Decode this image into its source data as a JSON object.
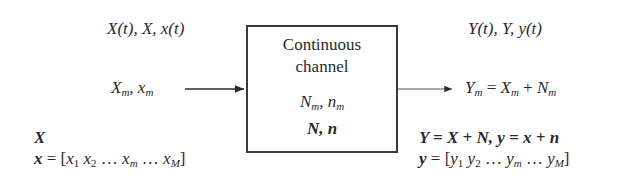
{
  "diagram": {
    "input": {
      "signal_label": "X(t), X, x(t)",
      "sample_label": "X_m, x_m",
      "vector_label": "X",
      "vector_def": "x = [x_1 x_2 … x_m … x_M]"
    },
    "channel": {
      "line1": "Continuous",
      "line2": "channel",
      "noise_sample": "N_m, n_m",
      "noise_vector": "N, n"
    },
    "output": {
      "signal_label": "Y(t), Y, y(t)",
      "sample_eq": "Y_m = X_m + N_m",
      "vector_eq": "Y = X + N, y = x + n",
      "vector_def": "y = [y_1 y_2 … y_m … y_M]"
    },
    "arrows": [
      {
        "from": "input-sample",
        "to": "channel-box"
      },
      {
        "from": "channel-box",
        "to": "output-sample"
      }
    ],
    "colors": {
      "ink": "#2a2a2a",
      "box_border": "#3a3a3a",
      "background": "#ffffff"
    }
  }
}
